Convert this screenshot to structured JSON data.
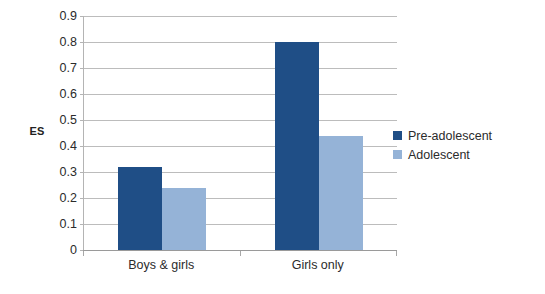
{
  "chart_data": {
    "type": "bar",
    "title": "",
    "xlabel": "",
    "ylabel": "ES",
    "categories": [
      "Boys & girls",
      "Girls only"
    ],
    "series": [
      {
        "name": "Pre-adolescent",
        "color": "#1f4e86",
        "values": [
          0.32,
          0.8
        ]
      },
      {
        "name": "Adolescent",
        "color": "#95b3d7",
        "values": [
          0.24,
          0.44
        ]
      }
    ],
    "ylim": [
      0,
      0.9
    ],
    "ytick_values": [
      0,
      0.1,
      0.2,
      0.3,
      0.4,
      0.5,
      0.6,
      0.7,
      0.8,
      0.9
    ],
    "ytick_labels": [
      "0",
      "0.1",
      "0.2",
      "0.3",
      "0.4",
      "0.5",
      "0.6",
      "0.7",
      "0.8",
      "0.9"
    ],
    "grid": true,
    "legend_position": "right"
  },
  "axis": {
    "y_title": "ES"
  },
  "legend": {
    "items": [
      {
        "label": "Pre-adolescent"
      },
      {
        "label": "Adolescent"
      }
    ]
  }
}
